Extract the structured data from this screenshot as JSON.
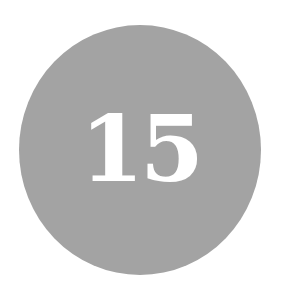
{
  "badge": {
    "number": "15",
    "background_color": "#a3a3a3",
    "text_color": "#ffffff"
  }
}
